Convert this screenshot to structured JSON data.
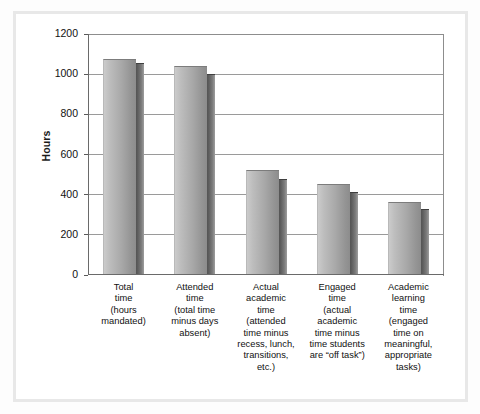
{
  "chart_data": {
    "type": "bar",
    "title": "",
    "xlabel": "",
    "ylabel": "Hours",
    "ylim": [
      0,
      1200
    ],
    "ytick_values": [
      0,
      200,
      400,
      600,
      800,
      1000,
      1200
    ],
    "ytick_labels": [
      "0",
      "200",
      "400",
      "600",
      "800",
      "1000",
      "1200"
    ],
    "grid": true,
    "legend": "none",
    "style": "3d-bar-gray-gradient",
    "categories": [
      "Total time (hours mandated)",
      "Attended time (total time minus days absent)",
      "Actual academic time (attended time minus recess, lunch, transitions, etc.)",
      "Engaged time (actual academic time minus time students are “off task”)",
      "Academic learning time (engaged time on meaningful, appropriate tasks)"
    ],
    "values": [
      1065,
      1030,
      515,
      445,
      355
    ],
    "side_values": [
      1045,
      990,
      470,
      405,
      320
    ]
  },
  "axis": {
    "y_title": "Hours",
    "ticks": [
      {
        "label": "1200",
        "value": 1200
      },
      {
        "label": "1000",
        "value": 1000
      },
      {
        "label": "800",
        "value": 800
      },
      {
        "label": "600",
        "value": 600
      },
      {
        "label": "400",
        "value": 400
      },
      {
        "label": "200",
        "value": 200
      },
      {
        "label": "0",
        "value": 0
      }
    ]
  },
  "bars": [
    {
      "name": "total-time",
      "head_line1": "Total",
      "head_line2": "time",
      "sub_line1": "(hours",
      "sub_line2": "mandated)",
      "sub_line3": "",
      "sub_line4": "",
      "sub_line5": "",
      "value": 1065
    },
    {
      "name": "attended-time",
      "head_line1": "Attended",
      "head_line2": "time",
      "sub_line1": "(total time",
      "sub_line2": "minus days",
      "sub_line3": "absent)",
      "sub_line4": "",
      "sub_line5": "",
      "value": 1030
    },
    {
      "name": "actual-academic-time",
      "head_line1": "Actual",
      "head_line2": "academic",
      "head_line3": "time",
      "sub_line1": "(attended",
      "sub_line2": "time minus",
      "sub_line3": "recess, lunch,",
      "sub_line4": "transitions,",
      "sub_line5": "etc.)",
      "value": 515
    },
    {
      "name": "engaged-time",
      "head_line1": "Engaged",
      "head_line2": "time",
      "sub_line1": "(actual",
      "sub_line2": "academic",
      "sub_line3": "time minus",
      "sub_line4": "time students",
      "sub_line5": "are “off task”)",
      "value": 445
    },
    {
      "name": "academic-learning-time",
      "head_line1": "Academic",
      "head_line2": "learning",
      "head_line3": "time",
      "sub_line1": "(engaged",
      "sub_line2": "time on",
      "sub_line3": "meaningful,",
      "sub_line4": "appropriate",
      "sub_line5": "tasks)",
      "value": 355
    }
  ],
  "colors": {
    "bar_front_light": "#cbcbcb",
    "bar_front_dark": "#8c8c8c",
    "bar_side_dark": "#4f4f4f",
    "gridline": "#9a9a9a",
    "axis": "#6a6a6a",
    "frame": "#e8e8e8",
    "background": "#ffffff",
    "text": "#111111"
  }
}
